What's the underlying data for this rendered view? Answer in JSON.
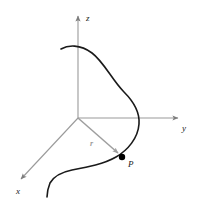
{
  "figure": {
    "background_color": "#ffffff",
    "width": 203,
    "height": 200
  },
  "colors": {
    "axis": "#9a9a9a",
    "curve": "#1a1a1a",
    "vector": "#9e9e9e",
    "point": "#000000",
    "label": "#1a1a1a",
    "vector_label": "#9a9a9a"
  },
  "origin": {
    "x": 78,
    "y": 118,
    "label": "O"
  },
  "axes": [
    {
      "name": "z-axis",
      "label": "z",
      "label_x": 86,
      "label_y": 21,
      "from_x": 78,
      "from_y": 118,
      "to_x": 78,
      "to_y": 14,
      "color": "#9a9a9a"
    },
    {
      "name": "y-axis",
      "label": "y",
      "label_x": 183,
      "label_y": 130,
      "from_x": 78,
      "from_y": 118,
      "to_x": 180,
      "to_y": 118,
      "color": "#9a9a9a"
    },
    {
      "name": "x-axis",
      "label": "x",
      "label_x": 20,
      "label_y": 192,
      "from_x": 78,
      "from_y": 118,
      "to_x": 19,
      "to_y": 181,
      "color": "#9a9a9a"
    }
  ],
  "curve": {
    "name": "space-curve",
    "color": "#1a1a1a",
    "stroke_width": 1.6,
    "path": "M 61 49 C 68 45, 80 44, 92 53 C 104 62, 112 80, 124 92 C 134 102, 140 112, 139 124 C 138 138, 128 150, 116 157 C 104 164, 88 167, 72 170 C 62 172, 54 176, 50 183 C 48 188, 47 193, 47 197"
  },
  "vector": {
    "name": "position-vector-r",
    "label": "r",
    "label_x": 92,
    "label_y": 145,
    "color": "#9e9e9e",
    "stroke_width": 1.5,
    "from_x": 78,
    "from_y": 118,
    "to_x": 120,
    "to_y": 155
  },
  "point": {
    "name": "point-P",
    "label": "P",
    "x": 122,
    "y": 157,
    "radius": 3.2,
    "label_x": 128,
    "label_y": 167,
    "color": "#000000"
  }
}
